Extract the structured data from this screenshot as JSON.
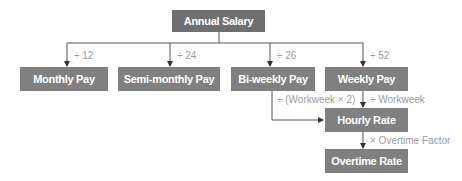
{
  "diagram": {
    "root": {
      "label": "Annual Salary"
    },
    "nodes": [
      {
        "id": "monthly",
        "label": "Monthly Pay",
        "edge_label": "÷ 12"
      },
      {
        "id": "semimonthly",
        "label": "Semi-monthly Pay",
        "edge_label": "÷ 24"
      },
      {
        "id": "biweekly",
        "label": "Bi-weekly Pay",
        "edge_label": "÷ 26"
      },
      {
        "id": "weekly",
        "label": "Weekly Pay",
        "edge_label": "÷ 52"
      },
      {
        "id": "hourly",
        "label": "Hourly Rate"
      },
      {
        "id": "overtime",
        "label": "Overtime Rate"
      }
    ],
    "edges": {
      "biweekly_to_hourly": "÷ (Workweek × 2)",
      "weekly_to_hourly": "÷ Workweek",
      "hourly_to_overtime": "× Overtime Factor"
    }
  }
}
